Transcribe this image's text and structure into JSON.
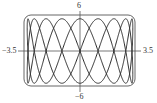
{
  "chart_data": {
    "type": "line",
    "title": "",
    "parametric": {
      "x": "3.3*sin(2t)",
      "y": "5.3*sin(9t)",
      "t_range": [
        0,
        6.2832
      ]
    },
    "xlim": [
      -3.5,
      3.5
    ],
    "ylim": [
      -6,
      6
    ],
    "tick_labels": {
      "x_min": "−3.5",
      "x_max": "3.5",
      "y_max": "6",
      "y_min": "−6"
    },
    "xlabel": "",
    "ylabel": "",
    "grid": false,
    "legend": null
  },
  "colors": {
    "curve": "#2a2a2a",
    "axes": "#555555",
    "frame": "#666666"
  }
}
